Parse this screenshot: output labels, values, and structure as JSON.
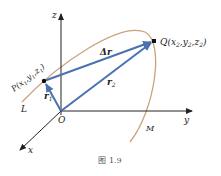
{
  "diagram": {
    "axes": {
      "x_label": "x",
      "y_label": "y",
      "z_label": "z",
      "origin_label": "O"
    },
    "points": {
      "P": {
        "label": "P(x",
        "sub1": "1",
        "y": ",y",
        "sub2": "1",
        "z": ",z",
        "sub3": "1",
        "close": ")"
      },
      "Q": {
        "label": "Q(x",
        "sub1": "2",
        "y": ",y",
        "sub2": "2",
        "z": ",z",
        "sub3": "2",
        "close": ")"
      }
    },
    "vectors": {
      "r1": {
        "label": "r",
        "sub": "1"
      },
      "r2": {
        "label": "r",
        "sub": "2"
      },
      "dr": {
        "label": "Δr"
      }
    },
    "curve": {
      "start_label": "L",
      "end_label": "M"
    },
    "caption": "图 1.9",
    "colors": {
      "vector": "#4a72b0",
      "curve": "#c8a27c",
      "axis": "#222222",
      "point": "#111111"
    }
  }
}
